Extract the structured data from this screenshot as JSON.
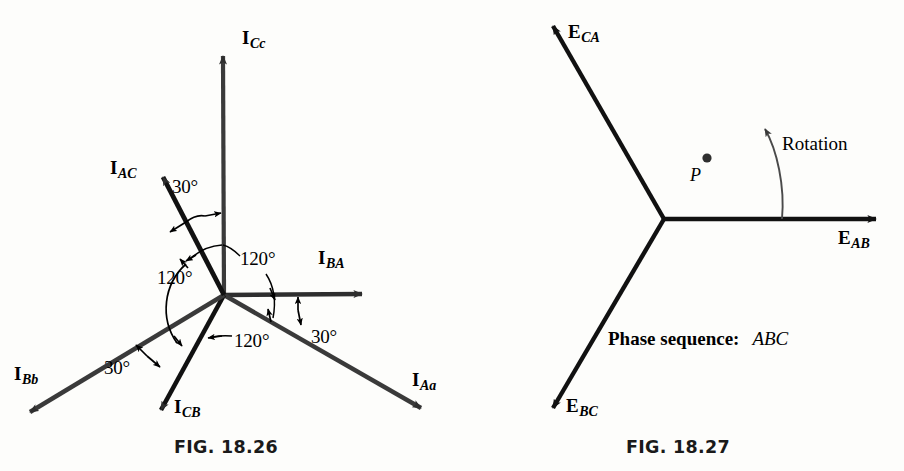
{
  "figures": [
    {
      "id": "fig-18-26",
      "caption": "FIG. 18.26",
      "origin": [
        224,
        295
      ],
      "vectors": [
        {
          "name": "I_Cc",
          "sym": "I",
          "sub": "Cc",
          "tip": [
            223,
            48
          ],
          "label_pos": [
            242,
            28
          ]
        },
        {
          "name": "I_BA",
          "sym": "I",
          "sub": "BA",
          "tip": [
            370,
            294
          ],
          "label_pos": [
            318,
            248
          ]
        },
        {
          "name": "I_Aa",
          "sym": "I",
          "sub": "Aa",
          "tip": [
            428,
            415
          ],
          "label_pos": [
            412,
            370
          ]
        },
        {
          "name": "I_CB",
          "sym": "I",
          "sub": "CB",
          "tip": [
            157,
            418
          ],
          "label_pos": [
            174,
            397
          ]
        },
        {
          "name": "I_Bb",
          "sym": "I",
          "sub": "Bb",
          "tip": [
            22,
            418
          ],
          "label_pos": [
            14,
            364
          ]
        },
        {
          "name": "I_AC",
          "sym": "I",
          "sub": "AC",
          "tip": [
            158,
            170
          ],
          "label_pos": [
            110,
            158
          ]
        }
      ],
      "angles": [
        {
          "value": "30°",
          "pos": [
            172,
            177
          ]
        },
        {
          "value": "120°",
          "pos": [
            240,
            249
          ]
        },
        {
          "value": "120°",
          "pos": [
            157,
            268
          ]
        },
        {
          "value": "120°",
          "pos": [
            234,
            331
          ]
        },
        {
          "value": "30°",
          "pos": [
            311,
            327
          ]
        },
        {
          "value": "30°",
          "pos": [
            104,
            358
          ]
        }
      ]
    },
    {
      "id": "fig-18-27",
      "caption": "FIG. 18.27",
      "origin": [
        664,
        219
      ],
      "vectors": [
        {
          "name": "E_AB",
          "sym": "E",
          "sub": "AB",
          "tip": [
            884,
            219
          ],
          "label_pos": [
            838,
            228
          ]
        },
        {
          "name": "E_CA",
          "sym": "E",
          "sub": "CA",
          "tip": [
            547,
            15
          ],
          "label_pos": [
            568,
            22
          ]
        },
        {
          "name": "E_BC",
          "sym": "E",
          "sub": "BC",
          "tip": [
            548,
            415
          ],
          "label_pos": [
            566,
            396
          ]
        }
      ],
      "point": {
        "label": "P",
        "dot_pos": [
          707,
          155
        ],
        "label_pos": [
          690,
          166
        ]
      },
      "rotation": {
        "label": "Rotation",
        "label_pos": [
          782,
          134
        ]
      },
      "phase_sequence": {
        "prefix": "Phase sequence:",
        "value": "ABC",
        "pos": [
          608,
          329
        ]
      }
    }
  ],
  "colors": {
    "vector_stroke": "#3a3a3a",
    "vector_stroke_dark": "#111111",
    "annotation": "#000000",
    "background": "#fdfdfb",
    "caption": "#1a1a1a"
  }
}
